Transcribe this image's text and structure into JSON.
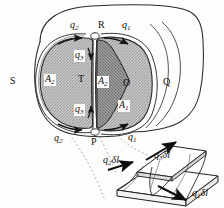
{
  "figure": {
    "type": "vector-field-flux-tube-diagram",
    "background_color": "#fdfdfc",
    "ink_color": "#1a1a1a",
    "shade_light": "#b9b9b9",
    "shade_dark": "#8a8a8a",
    "labels": {
      "top_left_flux": "q",
      "top_left_flux_sub": "2",
      "top_mid_point": "R",
      "top_right_flux": "q",
      "top_right_flux_sub": "1",
      "inner_top_flux": "q",
      "inner_top_flux_sub": "3",
      "inner_bottom_flux": "q",
      "inner_bottom_flux_sub": "3",
      "left_area": "A",
      "left_area_sub": "2",
      "mid_point_t": "T",
      "dark_area": "A",
      "dark_area_sub": "2",
      "right_point_o": "O",
      "right_area": "A",
      "right_area_sub": "1",
      "left_point_s": "S",
      "right_point_q": "Q",
      "bottom_left_flux": "q",
      "bottom_left_flux_sub": "2",
      "bottom_mid_point": "P",
      "bottom_right_flux": "q",
      "bottom_right_flux_sub": "1",
      "inset_left": "q",
      "inset_left_sub": "2",
      "inset_left_tail": "δl",
      "inset_mid": "q",
      "inset_mid_sub": "3",
      "inset_mid_tail": "δl",
      "inset_right": "q",
      "inset_right_sub": "1",
      "inset_right_tail": "δl"
    }
  }
}
